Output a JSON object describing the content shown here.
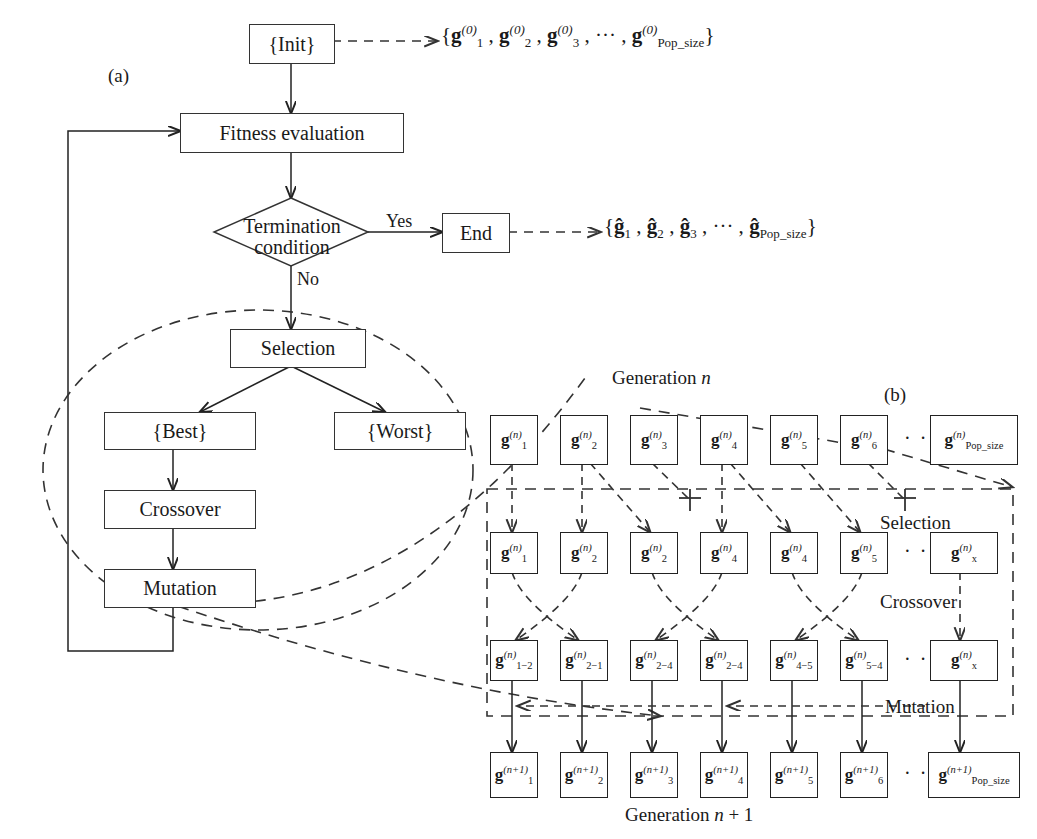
{
  "figure": {
    "panel_a_tag": "(a)",
    "panel_b_tag": "(b)"
  },
  "flowchart": {
    "init_box": "{Init}",
    "init_output": "{g₁⁽⁰⁾, g₂⁽⁰⁾, g₃⁽⁰⁾, ··· , g_Pop_size⁽⁰⁾}",
    "fitness_box": "Fitness evaluation",
    "decision_line1": "Termination",
    "decision_line2": "condition",
    "yes_label": "Yes",
    "no_label": "No",
    "end_box": "End",
    "end_output": "{ĝ₁, ĝ₂, ĝ₃, ··· , ĝ_Pop_size}",
    "selection_box": "Selection",
    "best_box": "{Best}",
    "worst_box": "{Worst}",
    "crossover_box": "Crossover",
    "mutation_box": "Mutation"
  },
  "detail": {
    "generation_n_label": "Generation n",
    "generation_n_italic": "n",
    "generation_next_label": "Generation n + 1",
    "step_selection": "Selection",
    "step_crossover": "Crossover",
    "step_mutation": "Mutation",
    "ellipsis": "· · ·",
    "rows": [
      {
        "name": "generation-n-row",
        "superscript": "(n)",
        "subscripts": [
          "1",
          "2",
          "3",
          "4",
          "5",
          "6"
        ],
        "last_subscript": "Pop_size"
      },
      {
        "name": "selection-row",
        "superscript": "(n)",
        "subscripts": [
          "1",
          "2",
          "2",
          "4",
          "4",
          "5"
        ],
        "last_subscript": "x"
      },
      {
        "name": "crossover-row",
        "superscript": "(n)",
        "subscripts": [
          "1−2",
          "2−1",
          "2−4",
          "2−4",
          "4−5",
          "5−4"
        ],
        "last_subscript": "x"
      },
      {
        "name": "generation-n-plus-1-row",
        "superscript": "(n+1)",
        "subscripts": [
          "1",
          "2",
          "3",
          "4",
          "5",
          "6"
        ],
        "last_subscript": "Pop_size"
      }
    ]
  },
  "colors": {
    "stroke": "#222222",
    "dashed": "#333333",
    "background": "#ffffff"
  }
}
